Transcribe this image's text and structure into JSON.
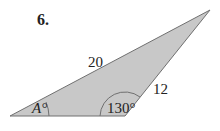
{
  "problem_number": "6.",
  "triangle": {
    "fill": "#c8c8c8",
    "stroke": "#707070",
    "sides": {
      "long_side": "20",
      "short_side": "12"
    },
    "angles": {
      "unknown_angle": "A°",
      "known_angle": "130°"
    }
  }
}
